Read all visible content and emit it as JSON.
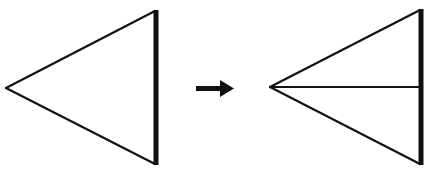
{
  "diagram": {
    "colors": {
      "stroke": "#111111",
      "background": "#ffffff"
    },
    "left_figure": {
      "name": "triangle",
      "apex": [
        6,
        88
      ],
      "top": [
        155,
        11
      ],
      "bottom": [
        155,
        164
      ],
      "thick_edge": "right"
    },
    "arrow": {
      "direction": "right",
      "from": [
        196,
        88
      ],
      "to": [
        234,
        88
      ]
    },
    "right_figure": {
      "name": "triangle-with-median-line",
      "apex": [
        270,
        87
      ],
      "top": [
        420,
        10
      ],
      "bottom": [
        420,
        164
      ],
      "thick_edge": "right",
      "inner_line": {
        "from": [
          270,
          87
        ],
        "to": [
          420,
          87
        ]
      }
    }
  }
}
